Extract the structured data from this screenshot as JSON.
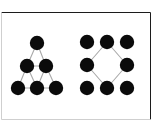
{
  "figure": {
    "background_color": "#ffffff",
    "node_color": "#0b0b0b",
    "edge_color": "#a9a9a9",
    "node_radius": 7.2,
    "edge_width": 1.1,
    "frame": {
      "stroke_color": "#1c1c1c",
      "stroke_width": 1,
      "faint_stroke_color": "#cfcfcf",
      "left": 1.5,
      "top": 12.5,
      "right": 150.5,
      "bottom": 119.5
    },
    "panels": [
      {
        "id": "left-panel",
        "name": "triangular-lattice-graph",
        "label": "",
        "node_count": 6,
        "edge_count": 9,
        "nodes": [
          {
            "id": "t1",
            "label": "",
            "x": 37,
            "y": 43
          },
          {
            "id": "m1",
            "label": "",
            "x": 27,
            "y": 66
          },
          {
            "id": "m2",
            "label": "",
            "x": 46,
            "y": 66
          },
          {
            "id": "b1",
            "label": "",
            "x": 18,
            "y": 88
          },
          {
            "id": "b2",
            "label": "",
            "x": 37,
            "y": 88
          },
          {
            "id": "b3",
            "label": "",
            "x": 56,
            "y": 88
          }
        ],
        "edges": [
          {
            "from": "t1",
            "to": "m1"
          },
          {
            "from": "t1",
            "to": "m2"
          },
          {
            "from": "m1",
            "to": "m2"
          },
          {
            "from": "m1",
            "to": "b1"
          },
          {
            "from": "m1",
            "to": "b2"
          },
          {
            "from": "m2",
            "to": "b2"
          },
          {
            "from": "m2",
            "to": "b3"
          },
          {
            "from": "b1",
            "to": "b2"
          },
          {
            "from": "b2",
            "to": "b3"
          }
        ]
      },
      {
        "id": "right-panel",
        "name": "diamond-in-grid-graph",
        "label": "",
        "node_count": 8,
        "edge_count": 4,
        "nodes": [
          {
            "id": "c1",
            "label": "",
            "x": 87,
            "y": 42
          },
          {
            "id": "c2",
            "label": "",
            "x": 107,
            "y": 42
          },
          {
            "id": "c3",
            "label": "",
            "x": 127,
            "y": 42
          },
          {
            "id": "c4",
            "label": "",
            "x": 87,
            "y": 65
          },
          {
            "id": "c5",
            "label": "",
            "x": 127,
            "y": 65
          },
          {
            "id": "c6",
            "label": "",
            "x": 87,
            "y": 88
          },
          {
            "id": "c7",
            "label": "",
            "x": 107,
            "y": 88
          },
          {
            "id": "c8",
            "label": "",
            "x": 127,
            "y": 88
          }
        ],
        "edges": [
          {
            "from": "c2",
            "to": "c5"
          },
          {
            "from": "c5",
            "to": "c7"
          },
          {
            "from": "c7",
            "to": "c4"
          },
          {
            "from": "c4",
            "to": "c2"
          }
        ]
      }
    ]
  }
}
